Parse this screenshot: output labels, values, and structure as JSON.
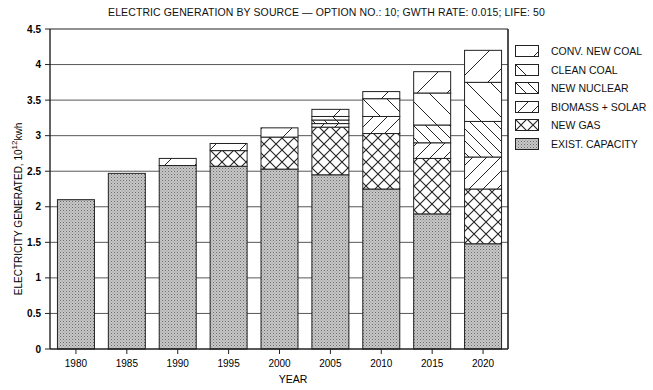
{
  "chart_data": {
    "type": "bar",
    "stacked": true,
    "title": "ELECTRIC GENERATION BY SOURCE — OPTION NO.: 10; GWTH RATE: 0.015; LIFE: 50",
    "xlabel": "YEAR",
    "ylabel": "ELECTRICITY GENERATED, 10^12 kwh",
    "ylim": [
      0,
      4.5
    ],
    "yticks": [
      "0",
      "0.5",
      "1",
      "1.5",
      "2",
      "2.5",
      "3",
      "3.5",
      "4",
      "4.5"
    ],
    "grid": "horizontal",
    "legend_position": "right",
    "categories": [
      "1980",
      "1985",
      "1990",
      "1995",
      "2000",
      "2005",
      "2010",
      "2015",
      "2020"
    ],
    "series": [
      {
        "name": "EXIST. CAPACITY",
        "pattern": "dots",
        "values": [
          2.1,
          2.47,
          2.58,
          2.57,
          2.53,
          2.45,
          2.25,
          1.9,
          1.48
        ]
      },
      {
        "name": "NEW GAS",
        "pattern": "crosshatch",
        "values": [
          0,
          0,
          0,
          0.22,
          0.45,
          0.67,
          0.78,
          0.78,
          0.77
        ]
      },
      {
        "name": "BIOMASS+SOLAR",
        "pattern": "diag-up",
        "values": [
          0,
          0,
          0,
          0,
          0,
          0.05,
          0.24,
          0.22,
          0.45
        ]
      },
      {
        "name": "NEW NUCLEAR",
        "pattern": "diag-down",
        "values": [
          0,
          0,
          0,
          0,
          0,
          0.05,
          0.0,
          0.25,
          0.5
        ]
      },
      {
        "name": "CLEAN COAL",
        "pattern": "diag-down-sparse",
        "values": [
          0,
          0,
          0,
          0,
          0,
          0.05,
          0.25,
          0.45,
          0.55
        ]
      },
      {
        "name": "CONV. NEW COAL",
        "pattern": "diag-up-sparse",
        "values": [
          0,
          0,
          0.1,
          0.1,
          0.13,
          0.1,
          0.1,
          0.3,
          0.45
        ]
      }
    ]
  },
  "legend": [
    {
      "label": "CONV. NEW COAL",
      "pattern": "diag-up-sparse"
    },
    {
      "label": "CLEAN COAL",
      "pattern": "diag-down-sparse"
    },
    {
      "label": "NEW NUCLEAR",
      "pattern": "diag-down"
    },
    {
      "label": "BIOMASS + SOLAR",
      "pattern": "diag-up"
    },
    {
      "label": "NEW GAS",
      "pattern": "crosshatch"
    },
    {
      "label": "EXIST. CAPACITY",
      "pattern": "dots"
    }
  ]
}
